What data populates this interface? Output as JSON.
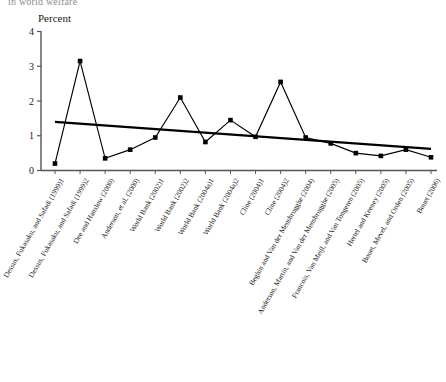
{
  "figure": {
    "cut_title": "in world welfare",
    "axis_title": "Percent"
  },
  "chart_data": {
    "type": "line",
    "title": "in world welfare",
    "xlabel": "",
    "ylabel": "Percent",
    "ylim": [
      0,
      4
    ],
    "yticks": [
      0,
      1,
      2,
      3,
      4
    ],
    "grid": false,
    "legend": "none",
    "categories": [
      "Dessus, Fukasaku, and Safadi (1999)1",
      "Dessus, Fukasaku, and Safadi (1999)2",
      "Dee and Hanslow (2000)",
      "Anderson, et al. (2000)",
      "World Bank (2002)1",
      "World Bank (2002)2",
      "World Bank (2004a)1",
      "World Bank (2004a)2",
      "Cline (2004)1",
      "Cline (2004)2",
      "Beghin and Van der Mensbrugghe (2004)",
      "Anderson, Martin, and Van der Mensbrugghe (2005)",
      "Francois, Van Meijl, and Van Tongeren (2005)",
      "Hertel and Keeney (2005)",
      "Bouet, Mevel, and Orden (2005)",
      "Bouet (2006)"
    ],
    "series": [
      {
        "name": "Estimated welfare gain",
        "marker": "filled-square",
        "values": [
          0.2,
          3.15,
          0.35,
          0.6,
          0.95,
          2.1,
          0.82,
          1.45,
          0.97,
          2.55,
          0.95,
          0.78,
          0.5,
          0.42,
          0.6,
          0.38
        ]
      },
      {
        "name": "Linear trend",
        "marker": "none",
        "trend": true,
        "endpoints": [
          1.4,
          0.62
        ]
      }
    ],
    "colors": {
      "line": "#000000",
      "marker": "#000000",
      "trend": "#000000",
      "axis": "#555555"
    }
  }
}
